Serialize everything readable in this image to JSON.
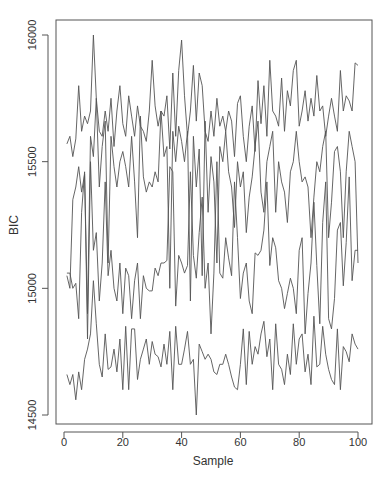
{
  "chart_data": {
    "type": "line",
    "title": "",
    "xlabel": "Sample",
    "ylabel": "BIC",
    "xlim": [
      1,
      100
    ],
    "ylim": [
      14500,
      16000
    ],
    "x_ticks": [
      0,
      20,
      40,
      60,
      80,
      100
    ],
    "y_ticks": [
      14500,
      15000,
      15500,
      16000
    ],
    "grid": false,
    "legend": null,
    "line_color": "#555555",
    "series": [
      {
        "name": "chain-1",
        "values": [
          15570,
          15600,
          15520,
          15590,
          15800,
          15620,
          15680,
          15650,
          15700,
          16000,
          15750,
          15620,
          15600,
          15700,
          15620,
          15750,
          15560,
          15700,
          15800,
          15650,
          15600,
          15760,
          15680,
          15600,
          15720,
          15640,
          15620,
          15580,
          15700,
          15900,
          15720,
          15640,
          15700,
          15680,
          15760,
          15550,
          15850,
          15600,
          15860,
          15980,
          15760,
          15600,
          15700,
          15880,
          15660,
          15850,
          15800,
          15620,
          15580,
          15700,
          15600,
          15750,
          15640,
          15680,
          15620,
          15700,
          15660,
          15520,
          15730,
          15760,
          15600,
          15500,
          15640,
          15720,
          15540,
          15820,
          15650,
          15800,
          15600,
          15900,
          15700,
          15680,
          15640,
          15830,
          15620,
          15780,
          15720,
          15860,
          15900,
          15640,
          15700,
          15780,
          15660,
          15750,
          15680,
          15840,
          15700,
          15720,
          15600,
          15680,
          15750,
          15680,
          15620,
          15860,
          15700,
          15760,
          15740,
          15700,
          15890,
          15880
        ]
      },
      {
        "name": "chain-2",
        "values": [
          15050,
          15000,
          15350,
          15400,
          15480,
          15380,
          15450,
          14900,
          15600,
          15520,
          15750,
          15400,
          15560,
          15660,
          15100,
          15600,
          15480,
          15400,
          15500,
          15540,
          15480,
          15400,
          15600,
          15420,
          15200,
          15680,
          15440,
          15380,
          15420,
          15400,
          15460,
          15420,
          15700,
          15520,
          15560,
          15000,
          15620,
          15500,
          15640,
          15580,
          15500,
          15620,
          14950,
          15600,
          15400,
          15550,
          15050,
          15660,
          15300,
          15520,
          15420,
          15100,
          15560,
          15500,
          15620,
          15460,
          15400,
          15240,
          15500,
          15400,
          15460,
          15220,
          15360,
          15440,
          15560,
          15660,
          15380,
          15300,
          15500,
          15560,
          15620,
          15300,
          15500,
          15420,
          15380,
          15260,
          15460,
          15500,
          15620,
          15500,
          15420,
          15440,
          15400,
          15200,
          15360,
          15500,
          15460,
          15560,
          15620,
          15200,
          15340,
          15540,
          15560,
          15460,
          15200,
          15460,
          15620,
          15560,
          15500,
          15100
        ]
      },
      {
        "name": "chain-3",
        "values": [
          15060,
          15060,
          15000,
          15020,
          14880,
          15300,
          15460,
          14800,
          15500,
          15150,
          15220,
          14950,
          15100,
          15420,
          15050,
          15150,
          15000,
          14950,
          15100,
          14900,
          15080,
          15050,
          14880,
          15030,
          15100,
          14880,
          15050,
          15000,
          14990,
          14990,
          15080,
          15050,
          15100,
          15100,
          15110,
          15480,
          15460,
          14930,
          15130,
          15100,
          15060,
          15090,
          15460,
          15130,
          15040,
          15220,
          15360,
          15000,
          15100,
          14820,
          15060,
          15500,
          15060,
          15040,
          15200,
          15120,
          15050,
          15420,
          15200,
          14960,
          15060,
          15100,
          14950,
          14900,
          15140,
          15130,
          15150,
          15230,
          15420,
          15090,
          15200,
          15160,
          15030,
          15000,
          14920,
          14980,
          15040,
          15000,
          14900,
          15150,
          15200,
          14820,
          14980,
          15100,
          15340,
          15090,
          14860,
          15260,
          15420,
          14880,
          14840,
          14960,
          15230,
          15260,
          15010,
          15180,
          15440,
          15030,
          15150,
          15150
        ]
      },
      {
        "name": "chain-4",
        "values": [
          14660,
          14620,
          14660,
          14560,
          14670,
          14600,
          14720,
          14760,
          14820,
          15030,
          14860,
          14700,
          14650,
          14820,
          14680,
          14690,
          14760,
          14670,
          14800,
          14600,
          14850,
          14600,
          14840,
          14840,
          14640,
          14720,
          14760,
          14800,
          14700,
          14790,
          14740,
          14730,
          14690,
          14780,
          14700,
          14830,
          14600,
          14850,
          14700,
          14700,
          14760,
          14830,
          14700,
          14720,
          14500,
          14780,
          14750,
          14720,
          14740,
          14720,
          14670,
          14660,
          14700,
          14700,
          14740,
          14700,
          14650,
          14610,
          14600,
          14700,
          14840,
          14620,
          14830,
          14700,
          14770,
          14740,
          14820,
          14870,
          14730,
          14800,
          14600,
          14860,
          14700,
          14680,
          14620,
          14740,
          14660,
          14860,
          14700,
          14800,
          14820,
          14670,
          14740,
          14620,
          14890,
          14690,
          14700,
          14850,
          14740,
          14680,
          14640,
          14620,
          14840,
          14600,
          14770,
          14750,
          14710,
          14820,
          14780,
          14760
        ]
      }
    ]
  },
  "axes": {
    "xlabel": "Sample",
    "ylabel": "BIC",
    "x_tick_labels": [
      "0",
      "20",
      "40",
      "60",
      "80",
      "100"
    ],
    "y_tick_labels": [
      "14500",
      "15000",
      "15500",
      "16000"
    ]
  }
}
